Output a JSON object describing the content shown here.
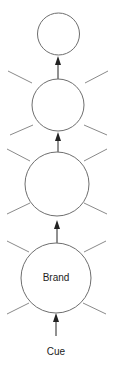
{
  "diagram": {
    "type": "spreading-activation",
    "nodes": [
      {
        "id": "node-4",
        "label": "",
        "cx": 58.5,
        "cy": 34,
        "r": 21
      },
      {
        "id": "node-3",
        "label": "",
        "cx": 58,
        "cy": 105,
        "r": 26
      },
      {
        "id": "node-2",
        "label": "",
        "cx": 57,
        "cy": 184,
        "r": 32
      },
      {
        "id": "brand",
        "label": "Brand",
        "cx": 56,
        "cy": 278,
        "r": 35
      }
    ],
    "input": {
      "label": "Cue"
    },
    "edges": [
      {
        "from": "Cue",
        "to": "brand"
      },
      {
        "from": "brand",
        "to": "node-2"
      },
      {
        "from": "node-2",
        "to": "node-3"
      },
      {
        "from": "node-3",
        "to": "node-4"
      }
    ],
    "colors": {
      "stroke": "#6e6e6e",
      "ray": "#8a8a8a",
      "arrow": "#222222"
    }
  }
}
